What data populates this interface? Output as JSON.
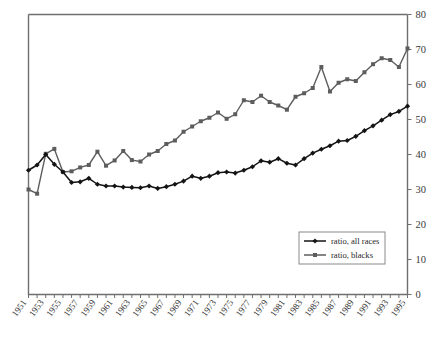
{
  "chart_data": {
    "type": "line",
    "title": "",
    "xlabel": "",
    "ylabel": "",
    "ylim": [
      0,
      80
    ],
    "ytick_step": 10,
    "yticks": [
      0,
      10,
      20,
      30,
      40,
      50,
      60,
      70,
      80
    ],
    "grid": false,
    "y_axis_position": "right",
    "legend_position": "inner-lower-right",
    "x": [
      1951,
      1952,
      1953,
      1954,
      1955,
      1956,
      1957,
      1958,
      1959,
      1960,
      1961,
      1962,
      1963,
      1964,
      1965,
      1966,
      1967,
      1968,
      1969,
      1970,
      1971,
      1972,
      1973,
      1974,
      1975,
      1976,
      1977,
      1978,
      1979,
      1980,
      1981,
      1982,
      1983,
      1984,
      1985,
      1986,
      1987,
      1988,
      1989,
      1990,
      1991,
      1992,
      1993,
      1994,
      1995
    ],
    "xtick_labels": [
      "1951",
      "1953",
      "1955",
      "1957",
      "1959",
      "1961",
      "1963",
      "1965",
      "1967",
      "1969",
      "1971",
      "1973",
      "1975",
      "1977",
      "1979",
      "1981",
      "1983",
      "1985",
      "1987",
      "1989",
      "1991",
      "1993",
      "1995"
    ],
    "series": [
      {
        "name": "ratio, all races",
        "color": "#141414",
        "marker": "diamond",
        "values": [
          35.5,
          37.0,
          40.0,
          37.2,
          35.0,
          32.0,
          32.2,
          33.2,
          31.5,
          31.0,
          31.0,
          30.7,
          30.6,
          30.5,
          31.0,
          30.3,
          30.8,
          31.5,
          32.4,
          33.8,
          33.2,
          33.8,
          34.8,
          35.0,
          34.7,
          35.5,
          36.5,
          38.2,
          37.8,
          38.8,
          37.5,
          37.0,
          38.8,
          40.4,
          41.5,
          42.5,
          43.8,
          44.0,
          45.2,
          46.8,
          48.2,
          49.8,
          51.4,
          52.3,
          53.8
        ]
      },
      {
        "name": "ratio, blacks",
        "color": "#5d5d5d",
        "marker": "square",
        "values": [
          30.0,
          28.8,
          40.2,
          41.6,
          35.0,
          35.2,
          36.3,
          37.0,
          40.8,
          36.8,
          38.3,
          41.0,
          38.4,
          38.0,
          40.0,
          41.0,
          43.0,
          44.0,
          46.5,
          48.0,
          49.5,
          50.5,
          52.0,
          50.2,
          51.5,
          55.5,
          55.0,
          56.8,
          55.0,
          54.0,
          52.8,
          56.5,
          57.5,
          59.0,
          65.0,
          58.0,
          60.5,
          61.5,
          61.0,
          63.5,
          65.8,
          67.5,
          67.0,
          65.0,
          70.3
        ]
      }
    ],
    "legend_entries": [
      {
        "label": "ratio, all races",
        "color": "#141414",
        "marker": "diamond"
      },
      {
        "label": "ratio, blacks",
        "color": "#5d5d5d",
        "marker": "square"
      }
    ]
  }
}
